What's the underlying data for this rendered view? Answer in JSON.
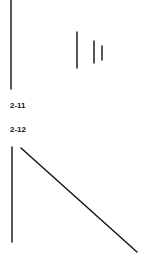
{
  "figures": [
    {
      "label": "2-11",
      "lines": [
        {
          "x1": 11,
          "y1": 0,
          "x2": 11,
          "y2": 89
        },
        {
          "x1": 77,
          "y1": 32,
          "x2": 77,
          "y2": 68
        },
        {
          "x1": 94,
          "y1": 41,
          "x2": 94,
          "y2": 63
        },
        {
          "x1": 102,
          "y1": 46,
          "x2": 102,
          "y2": 60
        }
      ]
    },
    {
      "label": "2-12",
      "lines": [
        {
          "x1": 12,
          "y1": 147,
          "x2": 12,
          "y2": 242
        },
        {
          "x1": 21,
          "y1": 148,
          "x2": 137,
          "y2": 252
        }
      ]
    }
  ],
  "colors": {
    "stroke": "#111111",
    "background": "#ffffff"
  }
}
